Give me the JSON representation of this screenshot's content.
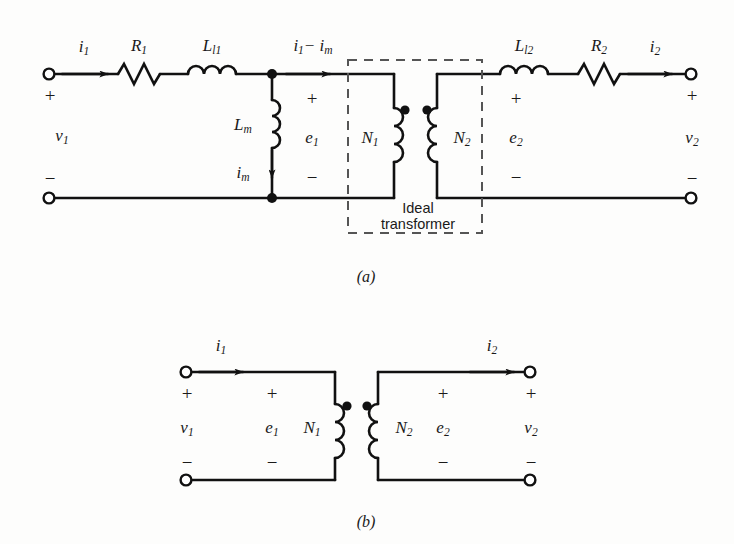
{
  "figure": {
    "type": "circuit-diagram",
    "colors": {
      "background": "#fdfdfc",
      "wire": "#111111",
      "dashed_box": "#555555",
      "text": "#1a1a1a"
    },
    "captions": {
      "a": "(a)",
      "b": "(b)"
    }
  },
  "diagram_a": {
    "name": "transformer-equivalent-circuit",
    "terminals": {
      "left_top_plus": "+",
      "left_bottom_minus": "−",
      "right_top_plus": "+",
      "right_bottom_minus": "−"
    },
    "labels": {
      "i1": "i",
      "i1_sub": "1",
      "R1": "R",
      "R1_sub": "1",
      "Ll1": "L",
      "Ll1_sub": "l1",
      "i1_minus_im": "i",
      "i1_minus_im_sub": "1",
      "i1_minus_im_tail": "− i",
      "i1_minus_im_tail_sub": "m",
      "Lm": "L",
      "Lm_sub": "m",
      "im": "i",
      "im_sub": "m",
      "e1": "e",
      "e1_sub": "1",
      "N1": "N",
      "N1_sub": "1",
      "N2": "N",
      "N2_sub": "2",
      "e2": "e",
      "e2_sub": "2",
      "Ll2": "L",
      "Ll2_sub": "l2",
      "R2": "R",
      "R2_sub": "2",
      "i2": "i",
      "i2_sub": "2",
      "v1": "v",
      "v1_sub": "1",
      "v2": "v",
      "v2_sub": "2",
      "mid_plus": "+",
      "mid_minus": "−",
      "sec_plus": "+",
      "sec_minus": "−"
    },
    "ideal_transformer_box_label": "Ideal\ntransformer",
    "ideal_transformer_box_label_line1": "Ideal",
    "ideal_transformer_box_label_line2": "transformer"
  },
  "diagram_b": {
    "name": "ideal-transformer-circuit",
    "labels": {
      "i1": "i",
      "i1_sub": "1",
      "i2": "i",
      "i2_sub": "2",
      "v1": "v",
      "v1_sub": "1",
      "e1": "e",
      "e1_sub": "1",
      "N1": "N",
      "N1_sub": "1",
      "N2": "N",
      "N2_sub": "2",
      "e2": "e",
      "e2_sub": "2",
      "v2": "v",
      "v2_sub": "2",
      "plus_left_outer": "+",
      "plus_left_inner": "+",
      "plus_right_inner": "+",
      "plus_right_outer": "+",
      "minus_left_outer": "−",
      "minus_left_inner": "−",
      "minus_right_inner": "−",
      "minus_right_outer": "−"
    }
  }
}
